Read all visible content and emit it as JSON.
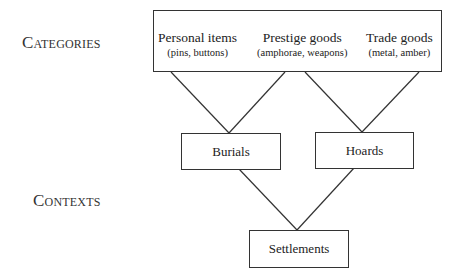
{
  "labels": {
    "categories": "Categories",
    "contexts": "Contexts"
  },
  "categories": [
    {
      "title": "Personal items",
      "examples": "(pins, buttons)"
    },
    {
      "title": "Prestige goods",
      "examples": "(amphorae, weapons)"
    },
    {
      "title": "Trade goods",
      "examples": "(metal, amber)"
    }
  ],
  "contexts": [
    {
      "label": "Burials"
    },
    {
      "label": "Hoards"
    },
    {
      "label": "Settlements"
    }
  ],
  "colors": {
    "line": "#333333",
    "text": "#222222",
    "background": "#ffffff"
  }
}
